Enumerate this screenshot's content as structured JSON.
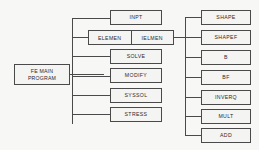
{
  "diagram": {
    "root": {
      "id": "fe-main-program",
      "line1": "FE MAIN",
      "line2": "PROGRAM"
    },
    "level2": [
      {
        "id": "inpt",
        "label": "INPT"
      },
      {
        "id": "elemen",
        "label": "ELEMEN",
        "label2": "IELMEN"
      },
      {
        "id": "solve",
        "label": "SOLVE"
      },
      {
        "id": "modify",
        "label": "MODIFY"
      },
      {
        "id": "syssol",
        "label": "SYSSOL"
      },
      {
        "id": "stress",
        "label": "STRESS"
      }
    ],
    "level3": [
      {
        "id": "shape",
        "label": "SHAPE"
      },
      {
        "id": "shapef",
        "label": "SHAPEF"
      },
      {
        "id": "b",
        "label": "B"
      },
      {
        "id": "bf",
        "label": "BF"
      },
      {
        "id": "inverq",
        "label": "INVERQ"
      },
      {
        "id": "mult",
        "label": "MULT"
      },
      {
        "id": "add",
        "label": "ADD"
      }
    ],
    "colors": {
      "line": "#4a4a4a",
      "box_fill": "#f4f4f2",
      "background": "#f7f7f5",
      "text": "#2b2b2b"
    }
  }
}
